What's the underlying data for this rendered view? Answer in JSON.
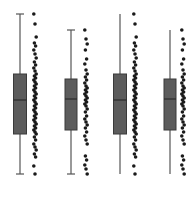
{
  "chart_data": {
    "type": "box",
    "title": "",
    "xlabel": "",
    "ylabel": "",
    "grid": false,
    "legend": null,
    "ylim": [
      0,
      160
    ],
    "colors": {
      "box_fill": "#5c5c5c",
      "box_edge": "#3a3a3a",
      "median": "#2a2a2a",
      "whisker": "#555555",
      "point": "#1a1a1a"
    },
    "groups": [
      {
        "x_center": 20,
        "box_width": 13,
        "points_x": 35,
        "caps": true,
        "whisker_low": 0,
        "q1": 40,
        "median": 74,
        "q3": 100,
        "whisker_high": 160,
        "points": [
          160,
          150,
          137,
          131,
          128,
          124,
          120,
          116,
          112,
          109,
          106,
          103,
          100,
          98,
          96,
          94,
          92,
          90,
          88,
          86,
          84,
          82,
          80,
          78,
          76,
          74,
          72,
          70,
          68,
          66,
          64,
          62,
          60,
          58,
          56,
          54,
          52,
          50,
          48,
          46,
          44,
          42,
          40,
          37,
          34,
          30,
          27,
          24,
          20,
          17,
          8,
          0
        ]
      },
      {
        "x_center": 71,
        "box_width": 12,
        "points_x": 86,
        "caps": true,
        "whisker_low": 0,
        "q1": 44,
        "median": 75,
        "q3": 95,
        "whisker_high": 144,
        "points": [
          144,
          135,
          130,
          124,
          115,
          110,
          104,
          100,
          97,
          94,
          91,
          88,
          86,
          84,
          82,
          80,
          78,
          76,
          74,
          72,
          70,
          68,
          65,
          62,
          58,
          55,
          52,
          49,
          46,
          42,
          38,
          34,
          30,
          18,
          14,
          9,
          5,
          0
        ]
      },
      {
        "x_center": 120,
        "box_width": 13,
        "points_x": 135,
        "caps": false,
        "whisker_low": 0,
        "q1": 40,
        "median": 74,
        "q3": 100,
        "whisker_high": 160,
        "points": [
          160,
          150,
          137,
          131,
          128,
          124,
          120,
          116,
          112,
          109,
          106,
          103,
          100,
          98,
          96,
          94,
          92,
          90,
          88,
          86,
          84,
          82,
          80,
          78,
          76,
          74,
          72,
          70,
          68,
          66,
          64,
          62,
          60,
          58,
          56,
          54,
          52,
          50,
          48,
          46,
          44,
          42,
          40,
          37,
          34,
          30,
          27,
          24,
          20,
          17,
          8,
          0
        ]
      },
      {
        "x_center": 170,
        "box_width": 12,
        "points_x": 183,
        "caps": false,
        "whisker_low": 0,
        "q1": 44,
        "median": 75,
        "q3": 95,
        "whisker_high": 144,
        "points": [
          144,
          135,
          130,
          124,
          115,
          110,
          104,
          100,
          97,
          94,
          91,
          88,
          86,
          84,
          82,
          80,
          78,
          76,
          74,
          72,
          70,
          68,
          65,
          62,
          58,
          55,
          52,
          49,
          46,
          42,
          38,
          34,
          30,
          18,
          14,
          9,
          5,
          0
        ]
      }
    ],
    "plot_area": {
      "y_bottom_px": 174,
      "y_top_px": 14
    }
  }
}
